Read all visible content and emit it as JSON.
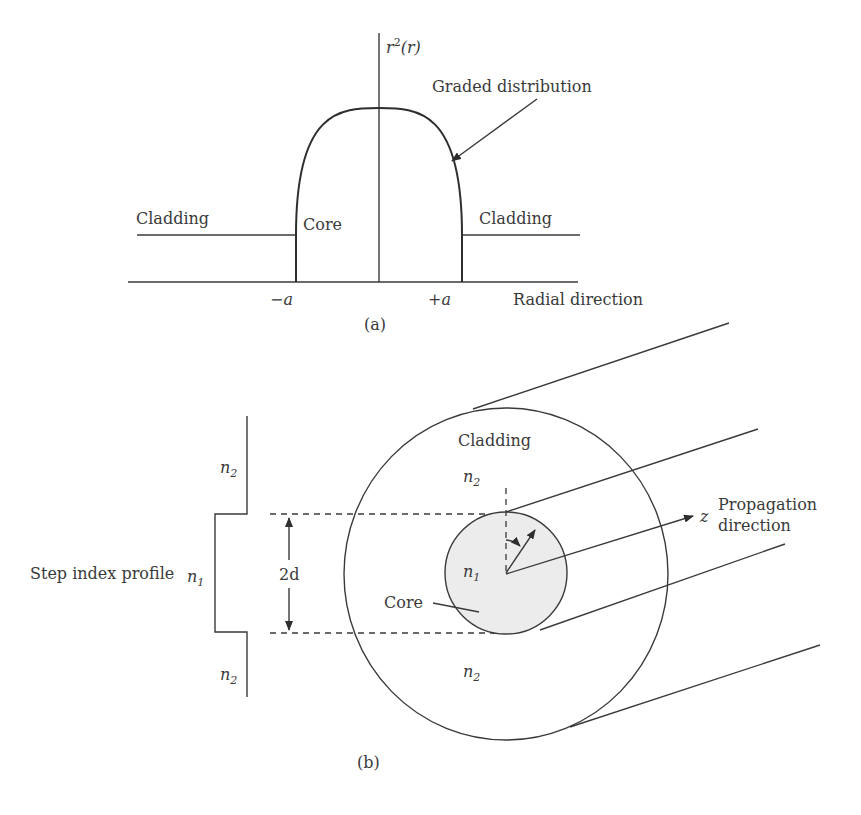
{
  "figure_a": {
    "y_axis_label": "r",
    "y_axis_label_sup": "2",
    "y_axis_label_arg": "(r)",
    "graded_label": "Graded distribution",
    "cladding_left": "Cladding",
    "cladding_right": "Cladding",
    "core_label": "Core",
    "tick_minus_a": "−a",
    "tick_plus_a": "+a",
    "x_axis_label": "Radial direction",
    "caption": "(a)"
  },
  "figure_b": {
    "profile_label": "Step index profile",
    "n_symbol": "n",
    "n1_sub": "1",
    "n2_sub": "2",
    "diameter_label": "2d",
    "cladding_label": "Cladding",
    "core_label": "Core",
    "axis_symbol": "z",
    "propagation_line1": "Propagation",
    "propagation_line2": "direction",
    "caption": "(b)",
    "core_fill": "#ececec"
  }
}
